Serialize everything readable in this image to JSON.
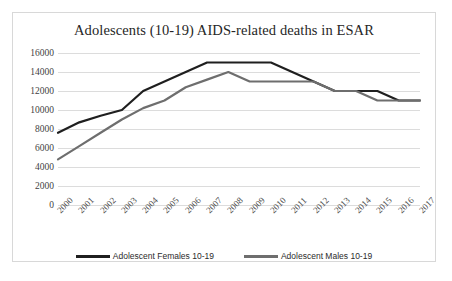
{
  "chart_data": {
    "type": "line",
    "title": "Adolescents (10-19) AIDS-related deaths in ESAR",
    "xlabel": "",
    "ylabel": "",
    "categories": [
      "2000",
      "2001",
      "2002",
      "2003",
      "2004",
      "2005",
      "2006",
      "2007",
      "2008",
      "2009",
      "2010",
      "2011",
      "2012",
      "2013",
      "2014",
      "2015",
      "2016",
      "2017"
    ],
    "ylim": [
      0,
      16000
    ],
    "yticks": [
      0,
      2000,
      4000,
      6000,
      8000,
      10000,
      12000,
      14000,
      16000
    ],
    "ytick_labels": [
      "0",
      "2000",
      "4000",
      "6000",
      "8000",
      "10000",
      "12000",
      "14000",
      "16000"
    ],
    "grid": "horizontal",
    "legend_position": "bottom",
    "series": [
      {
        "name": "Adolescent Females 10-19",
        "color": "#1f1f1f",
        "values": [
          7600,
          8700,
          9400,
          10000,
          12000,
          13000,
          14000,
          15000,
          15000,
          15000,
          15000,
          14000,
          13000,
          12000,
          12000,
          12000,
          11000,
          11000
        ]
      },
      {
        "name": "Adolescent Males 10-19",
        "color": "#6e6e6e",
        "values": [
          4800,
          6200,
          7600,
          9000,
          10200,
          11000,
          12400,
          13200,
          14000,
          13000,
          13000,
          13000,
          13000,
          12000,
          12000,
          11000,
          11000,
          11000
        ]
      }
    ]
  },
  "frame": {
    "border_color": "#d8d8d8",
    "background": "#ffffff"
  }
}
